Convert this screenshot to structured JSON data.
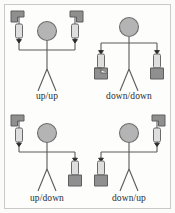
{
  "figure": {
    "border_color": "#c9c9c6",
    "background_color": "#fdfdfc"
  },
  "colors": {
    "stroke": "#5a5a5a",
    "head_fill": "#b4b4b4",
    "head_stroke": "#6e6e6e",
    "block_fill": "#8f8f8f",
    "block_stroke": "#5f5f5f",
    "weight_fill": "#dedede",
    "weight_stroke": "#6a6a6a",
    "arrow": "#2a2a2a",
    "text": "#2b2b2b"
  },
  "panels": [
    {
      "id": "up-up",
      "label": "up/up",
      "left_arm": "up",
      "right_arm": "up",
      "arrow_direction_left": "down",
      "arrow_direction_right": "down"
    },
    {
      "id": "down-down",
      "label": "down/down",
      "left_arm": "down",
      "right_arm": "down",
      "arrow_direction_left": "down",
      "arrow_direction_right": "down"
    },
    {
      "id": "up-down",
      "label": "up/down",
      "left_arm": "up",
      "right_arm": "down",
      "arrow_direction_left": "down",
      "arrow_direction_right": "down"
    },
    {
      "id": "down-up",
      "label": "down/up",
      "left_arm": "down",
      "right_arm": "up",
      "arrow_direction_left": "down",
      "arrow_direction_right": "down"
    }
  ]
}
